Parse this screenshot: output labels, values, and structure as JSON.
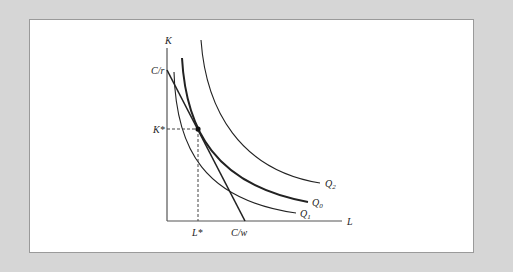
{
  "figure": {
    "type": "isoquant-isocost diagram",
    "axes": {
      "y_label": "K",
      "x_label": "L"
    },
    "isocost": {
      "y_intercept_label": "C/r",
      "x_intercept_label": "C/w"
    },
    "optimum": {
      "k_label": "K*",
      "l_label": "L*"
    },
    "isoquants": [
      {
        "id": "Q2",
        "label": "Q",
        "subscript": "2"
      },
      {
        "id": "Q0",
        "label": "Q",
        "subscript": "0"
      },
      {
        "id": "Q1",
        "label": "Q",
        "subscript": "1"
      }
    ],
    "colors": {
      "background": "#d6d6d6",
      "panel": "#ffffff",
      "line": "#222222",
      "axis": "#555555"
    }
  }
}
